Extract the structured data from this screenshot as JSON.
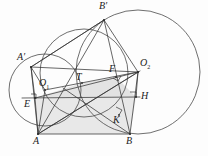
{
  "figure": {
    "background": "#fdfdfd",
    "stroke_color": "#3a3a3a",
    "thin_stroke_color": "#555555",
    "shade_color": "#d9d9d9",
    "width": 208,
    "height": 156
  },
  "labels": {
    "A": "A",
    "B": "B",
    "A_prime": "A′",
    "B_prime": "B′",
    "O1_base": "O",
    "O1_sub": "1",
    "O2_base": "O",
    "O2_sub": "2",
    "T": "T",
    "E": "E",
    "F": "F",
    "H": "H",
    "K": "K"
  },
  "points": {
    "A": {
      "x": 38,
      "y": 134,
      "label": "A",
      "label_x": 34,
      "label_y": 137
    },
    "B": {
      "x": 130,
      "y": 134,
      "label": "B",
      "label_x": 127,
      "label_y": 137
    },
    "A_prime": {
      "x": 31,
      "y": 67,
      "label": "A′",
      "label_x": 20,
      "label_y": 57
    },
    "B_prime": {
      "x": 104,
      "y": 20,
      "label": "B′",
      "label_x": 100,
      "label_y": 3
    },
    "O1": {
      "x": 45,
      "y": 90,
      "label": "O1",
      "label_x": 40,
      "label_y": 77
    },
    "O2": {
      "x": 138,
      "y": 72,
      "label": "O2",
      "label_x": 140,
      "label_y": 62
    },
    "T": {
      "x": 82,
      "y": 83,
      "label": "T",
      "label_x": 78,
      "label_y": 74
    },
    "E": {
      "x": 35,
      "y": 98,
      "label": "E",
      "label_x": 27,
      "label_y": 100
    },
    "F": {
      "x": 116,
      "y": 77,
      "label": "F",
      "label_x": 110,
      "label_y": 66
    },
    "H": {
      "x": 136,
      "y": 97,
      "label": "H",
      "label_x": 141,
      "label_y": 93
    },
    "K": {
      "x": 119,
      "y": 115,
      "label": "K",
      "label_x": 114,
      "label_y": 117
    }
  },
  "circles": [
    {
      "name": "circle-O1",
      "cx": 45,
      "cy": 90,
      "r": 36
    },
    {
      "name": "circle-O2",
      "cx": 138,
      "cy": 72,
      "r": 62
    },
    {
      "name": "circle-inscribed",
      "cx": 84,
      "cy": 73,
      "r": 44
    }
  ],
  "segments": [
    {
      "name": "seg-A-B",
      "x1": 38,
      "y1": 134,
      "x2": 130,
      "y2": 134
    },
    {
      "name": "seg-A-Bprime",
      "x1": 38,
      "y1": 134,
      "x2": 104,
      "y2": 20
    },
    {
      "name": "seg-B-Bprime",
      "x1": 130,
      "y1": 134,
      "x2": 104,
      "y2": 20
    },
    {
      "name": "seg-Aprime-Bprime",
      "x1": 31,
      "y1": 67,
      "x2": 104,
      "y2": 20
    },
    {
      "name": "seg-Aprime-A",
      "x1": 31,
      "y1": 67,
      "x2": 38,
      "y2": 134
    },
    {
      "name": "seg-Aprime-O1",
      "x1": 31,
      "y1": 67,
      "x2": 45,
      "y2": 90
    },
    {
      "name": "seg-Aprime-E",
      "x1": 31,
      "y1": 67,
      "x2": 35,
      "y2": 98
    },
    {
      "name": "seg-O1-A",
      "x1": 45,
      "y1": 90,
      "x2": 38,
      "y2": 134
    },
    {
      "name": "seg-E-H",
      "x1": 35,
      "y1": 98,
      "x2": 136,
      "y2": 97
    },
    {
      "name": "seg-E-O1",
      "x1": 35,
      "y1": 98,
      "x2": 45,
      "y2": 90
    },
    {
      "name": "seg-O1-O2",
      "x1": 45,
      "y1": 90,
      "x2": 138,
      "y2": 72
    },
    {
      "name": "seg-O2-H",
      "x1": 138,
      "y1": 72,
      "x2": 136,
      "y2": 97
    },
    {
      "name": "seg-O2-B",
      "x1": 138,
      "y1": 72,
      "x2": 130,
      "y2": 134
    },
    {
      "name": "seg-O2-Bprime",
      "x1": 138,
      "y1": 72,
      "x2": 104,
      "y2": 20
    },
    {
      "name": "seg-tangent-upper",
      "x1": 31,
      "y1": 67,
      "x2": 138,
      "y2": 72
    },
    {
      "name": "seg-A-K-O2",
      "x1": 38,
      "y1": 134,
      "x2": 138,
      "y2": 72
    },
    {
      "name": "seg-E-A",
      "x1": 35,
      "y1": 98,
      "x2": 38,
      "y2": 134
    },
    {
      "name": "seg-T-F",
      "x1": 82,
      "y1": 83,
      "x2": 116,
      "y2": 77
    },
    {
      "name": "seg-A-T-F-O2",
      "x1": 38,
      "y1": 134,
      "x2": 138,
      "y2": 72
    }
  ],
  "shaded_regions": [
    {
      "name": "shade-upper-quad",
      "points": "82,83 116,77 136,97 35,98"
    },
    {
      "name": "shade-lower-quad",
      "points": "35,98 136,97 130,134 38,134"
    }
  ],
  "right_angle_marks": [
    {
      "name": "right-angle-F",
      "x": 116,
      "y": 77,
      "rot": -10
    },
    {
      "name": "right-angle-H",
      "x": 136,
      "y": 97,
      "rot": 0
    },
    {
      "name": "right-angle-K",
      "x": 119,
      "y": 115,
      "rot": -32
    },
    {
      "name": "right-angle-E",
      "x": 35,
      "y": 98,
      "rot": 8
    }
  ]
}
